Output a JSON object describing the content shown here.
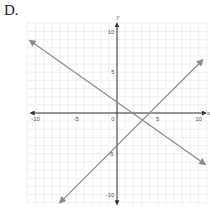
{
  "option_label": "D.",
  "chart_data": {
    "type": "line",
    "title": "",
    "xlabel": "x",
    "ylabel": "y",
    "xlim": [
      -10,
      10
    ],
    "ylim": [
      -10,
      10
    ],
    "grid": true,
    "x_ticks": [
      -10,
      -5,
      0,
      5,
      10
    ],
    "y_ticks": [
      -10,
      -5,
      5,
      10
    ],
    "tick_labels": {
      "x_neg10": "-10",
      "x_neg5": "-5",
      "origin": "0",
      "x_5": "5",
      "x_10": "10",
      "y_10": "10",
      "y_5": "5",
      "y_neg5": "-5",
      "y_neg10": "-10"
    },
    "series": [
      {
        "name": "line-decreasing",
        "equation_estimate": "y = -0.7x + 1",
        "x": [
          -10.7,
          10.8
        ],
        "y": [
          8.9,
          -6.3
        ],
        "arrows_both_ends": true,
        "color": "#8c8c8c"
      },
      {
        "name": "line-increasing",
        "equation_estimate": "y = x - 4",
        "x": [
          -7,
          10.5
        ],
        "y": [
          -11,
          6.5
        ],
        "arrows_both_ends": true,
        "color": "#8c8c8c"
      }
    ],
    "intersection_estimate": {
      "x": 2.9,
      "y": -1.1
    }
  },
  "colors": {
    "axis": "#333333",
    "grid": "#e6e6e6",
    "lines": "#8c8c8c"
  }
}
